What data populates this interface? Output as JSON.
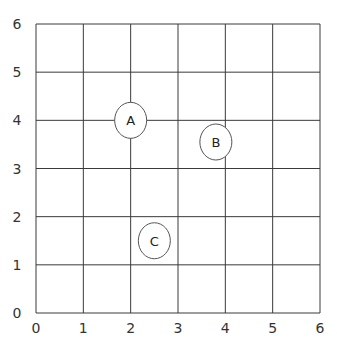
{
  "chart_data": {
    "type": "scatter",
    "title": "",
    "xlabel": "",
    "ylabel": "",
    "xlim": [
      0,
      6
    ],
    "ylim": [
      0,
      6
    ],
    "grid": true,
    "x_ticks": [
      "0",
      "1",
      "2",
      "3",
      "4",
      "5",
      "6"
    ],
    "y_ticks": [
      "0",
      "1",
      "2",
      "3",
      "4",
      "5",
      "6"
    ],
    "points": [
      {
        "label": "A",
        "x": 2.0,
        "y": 4.0
      },
      {
        "label": "B",
        "x": 3.8,
        "y": 3.55
      },
      {
        "label": "C",
        "x": 2.5,
        "y": 1.5
      }
    ]
  }
}
